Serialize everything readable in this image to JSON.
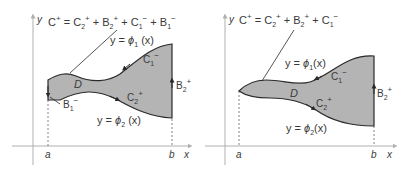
{
  "colors": {
    "region_fill": "#b4b4b4",
    "outline": "#2a2a2a",
    "axis": "#b0b0b0",
    "text": "#3a3a3a",
    "dashed": "#777777"
  },
  "figures": [
    {
      "id": "left",
      "formula": {
        "lhs": "C",
        "lhs_sup": "+",
        "eq": " = ",
        "terms": [
          {
            "base": "C",
            "sub": "2",
            "sup": "+"
          },
          {
            "base": "B",
            "sub": "2",
            "sup": "+"
          },
          {
            "base": "C",
            "sub": "1",
            "sup": "−"
          },
          {
            "base": "B",
            "sub": "1",
            "sup": "−"
          }
        ],
        "plus": " + "
      },
      "y_axis_label": "y",
      "x_axis_label": "x",
      "a_label": "a",
      "b_label": "b",
      "region_label": "D",
      "phi1_label": {
        "prefix": "y = ",
        "phi": "ϕ",
        "sub": "1",
        "arg": " (x)"
      },
      "phi2_label": {
        "prefix": "y = ",
        "phi": "ϕ",
        "sub": "2",
        "arg": " (x)"
      },
      "c1_label": {
        "base": "C",
        "sub": "1",
        "sup": "−"
      },
      "c2_label": {
        "base": "C",
        "sub": "2",
        "sup": "+"
      },
      "b1_label": {
        "base": "B",
        "sub": "1",
        "sup": "−"
      },
      "b2_label": {
        "base": "B",
        "sub": "2",
        "sup": "+"
      }
    },
    {
      "id": "right",
      "formula": {
        "lhs": "C",
        "lhs_sup": "+",
        "eq": " = ",
        "terms": [
          {
            "base": "C",
            "sub": "2",
            "sup": "+"
          },
          {
            "base": "B",
            "sub": "2",
            "sup": "+"
          },
          {
            "base": "C",
            "sub": "1",
            "sup": "−"
          }
        ],
        "plus": " + "
      },
      "y_axis_label": "y",
      "x_axis_label": "x",
      "a_label": "a",
      "b_label": "b",
      "region_label": "D",
      "phi1_label": {
        "prefix": "y = ",
        "phi": "ϕ",
        "sub": "1",
        "arg": "(x)"
      },
      "phi2_label": {
        "prefix": "y = ",
        "phi": "ϕ",
        "sub": "2",
        "arg": "(x)"
      },
      "c1_label": {
        "base": "C",
        "sub": "1",
        "sup": "−"
      },
      "c2_label": {
        "base": "C",
        "sub": "2",
        "sup": "+"
      },
      "b2_label": {
        "base": "B",
        "sub": "2",
        "sup": "+"
      }
    }
  ]
}
